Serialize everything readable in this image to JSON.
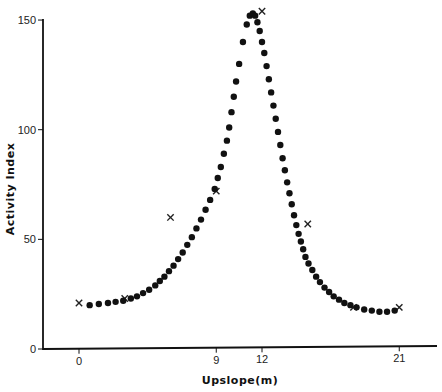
{
  "chart_data": {
    "type": "scatter",
    "title": "",
    "xlabel": "Upslope(m)",
    "ylabel": "Activity Index",
    "xlim": [
      -4.5,
      23.5
    ],
    "ylim": [
      0,
      150
    ],
    "grid": false,
    "legend": null,
    "x_ticks": [
      {
        "value": 0,
        "label": "0"
      },
      {
        "value": 9,
        "label": "9"
      },
      {
        "value": 12,
        "label": "12"
      },
      {
        "value": 21,
        "label": "21"
      }
    ],
    "y_ticks": [
      {
        "value": 0,
        "label": "0"
      },
      {
        "value": 50,
        "label": "50"
      },
      {
        "value": 100,
        "label": "100"
      },
      {
        "value": 150,
        "label": "150"
      }
    ],
    "series": [
      {
        "name": "observed",
        "marker": "x",
        "x": [
          0,
          3,
          6,
          9,
          12,
          15,
          18,
          21
        ],
        "y": [
          21,
          23,
          60,
          72,
          154,
          57,
          19,
          19
        ]
      },
      {
        "name": "fitted curve",
        "marker": "dot",
        "x": [
          0.7,
          1.3,
          1.9,
          2.4,
          2.9,
          3.4,
          3.8,
          4.2,
          4.6,
          5.0,
          5.3,
          5.6,
          5.9,
          6.2,
          6.5,
          6.8,
          7.1,
          7.4,
          7.7,
          8.0,
          8.3,
          8.6,
          8.9,
          9.1,
          9.3,
          9.5,
          9.7,
          9.85,
          10.0,
          10.15,
          10.3,
          10.5,
          10.75,
          11.0,
          11.2,
          11.4,
          11.55,
          11.7,
          11.85,
          12.0,
          12.15,
          12.3,
          12.45,
          12.6,
          12.75,
          12.9,
          13.05,
          13.2,
          13.35,
          13.5,
          13.65,
          13.8,
          13.95,
          14.1,
          14.25,
          14.4,
          14.55,
          14.7,
          14.85,
          15.05,
          15.3,
          15.55,
          15.8,
          16.1,
          16.4,
          16.7,
          17.05,
          17.4,
          17.8,
          18.2,
          18.7,
          19.2,
          19.7,
          20.2,
          20.7
        ],
        "y": [
          20,
          20.5,
          21,
          21.5,
          22,
          23,
          24,
          25.5,
          27,
          29,
          31,
          33,
          35.5,
          38,
          41,
          44,
          47.5,
          51,
          55,
          59,
          63.5,
          68,
          73,
          78,
          83,
          89,
          95,
          101,
          108,
          115,
          122,
          130,
          140,
          148,
          152,
          153,
          152,
          149,
          145,
          140,
          135,
          129,
          123,
          117,
          111,
          105,
          99,
          93,
          87,
          81.5,
          76,
          71,
          66,
          61,
          56.5,
          52.5,
          49,
          45.5,
          42,
          39,
          36,
          33,
          30.5,
          28,
          26,
          24,
          22.5,
          21,
          20,
          19,
          18,
          17.5,
          17,
          17,
          17.5
        ]
      }
    ]
  }
}
